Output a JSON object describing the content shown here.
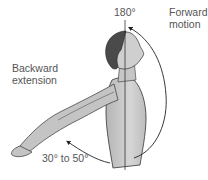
{
  "diagram": {
    "labels": {
      "top_angle": "180°",
      "forward": [
        "Forward",
        "motion"
      ],
      "backward": [
        "Backward",
        "extension"
      ],
      "bottom_angle": "30° to 50°"
    },
    "colors": {
      "skin": "#c8c8c8",
      "skin_shadow": "#a9a9a9",
      "hair": "#4a4a4a",
      "outline": "#333333",
      "text": "#555555"
    }
  }
}
